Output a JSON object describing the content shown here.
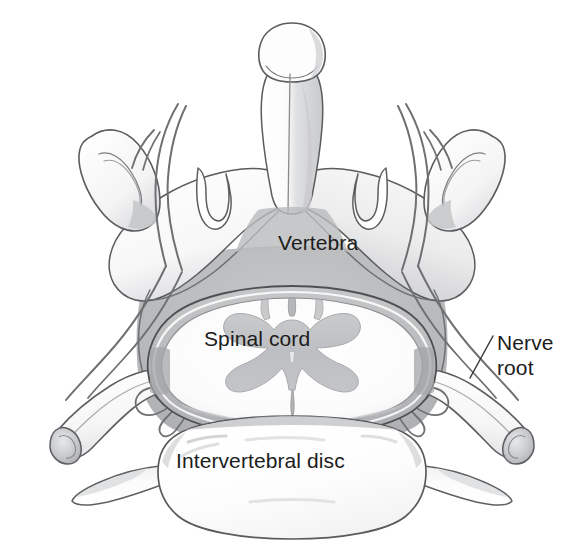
{
  "figure": {
    "background_color": "#ffffff",
    "ink_color": "#4a4a4a",
    "text_color": "#1c1c1c",
    "shade_light": "#ececed",
    "shade_mid": "#d2d3d4",
    "shade_dark": "#b3b4b6"
  },
  "labels": {
    "vertebra": "Vertebra",
    "spinal_cord": "Spinal cord",
    "intervertebral_disc": "Intervertebral disc",
    "nerve_root": "Nerve root"
  },
  "structures": [
    {
      "name": "spinous-process",
      "label": "Spinous process"
    },
    {
      "name": "lamina",
      "label": "Lamina"
    },
    {
      "name": "superior-articular-process",
      "label": "Superior articular process"
    },
    {
      "name": "inferior-articular-process",
      "label": "Inferior articular process"
    },
    {
      "name": "transverse-process",
      "label": "Transverse process"
    },
    {
      "name": "dura-mater",
      "label": "Dura mater"
    },
    {
      "name": "gray-matter",
      "label": "Gray matter butterfly"
    },
    {
      "name": "nerve-root-left",
      "label": "Left nerve root"
    },
    {
      "name": "nerve-root-right",
      "label": "Right nerve root"
    },
    {
      "name": "intervertebral-disc",
      "label": "Intervertebral disc"
    }
  ],
  "leader_lines": [
    {
      "name": "nerve-root-leader",
      "from": "Nerve root",
      "to": "right nerve root trunk"
    }
  ]
}
